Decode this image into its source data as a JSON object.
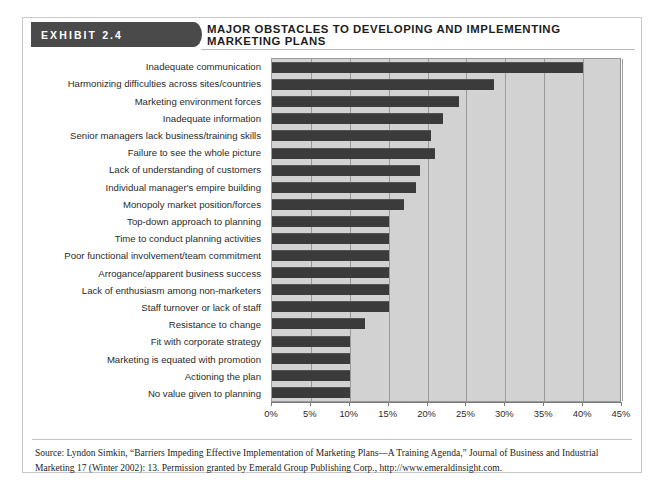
{
  "exhibit": {
    "tag": "EXHIBIT 2.4",
    "title": "MAJOR OBSTACLES TO DEVELOPING AND IMPLEMENTING MARKETING PLANS"
  },
  "source": {
    "text": "Source: Lyndon Simkin, “Barriers Impeding Effective Implementation of Marketing Plans—A Training Agenda,” Journal of Business and Industrial Marketing 17 (Winter 2002): 13. Permission granted by Emerald Group Publishing Corp., http://www.emeraldinsight.com."
  },
  "colors": {
    "bar": "#3b3b3b",
    "plot_background": "#d2d2d2",
    "gridline": "#9a9a9a",
    "tag_background": "#4a4a4a",
    "tag_text": "#ffffff",
    "text": "#2b2b2b"
  },
  "chart_data": {
    "type": "bar",
    "orientation": "horizontal",
    "title": "MAJOR OBSTACLES TO DEVELOPING AND IMPLEMENTING MARKETING PLANS",
    "xlabel": "",
    "ylabel": "",
    "xlim": [
      0,
      45
    ],
    "grid": true,
    "legend": false,
    "xticks": [
      0,
      5,
      10,
      15,
      20,
      25,
      30,
      35,
      40,
      45
    ],
    "xtick_labels": [
      "0%",
      "5%",
      "10%",
      "15%",
      "20%",
      "25%",
      "30%",
      "35%",
      "40%",
      "45%"
    ],
    "categories": [
      "Inadequate communication",
      "Harmonizing difficulties across sites/countries",
      "Marketing environment forces",
      "Inadequate information",
      "Senior managers lack business/training skills",
      "Failure to see the whole picture",
      "Lack of understanding of customers",
      "Individual manager's empire building",
      "Monopoly market position/forces",
      "Top-down approach to planning",
      "Time to conduct planning activities",
      "Poor functional involvement/team commitment",
      "Arrogance/apparent business success",
      "Lack of enthusiasm among non-marketers",
      "Staff turnover or lack of staff",
      "Resistance to change",
      "Fit with corporate strategy",
      "Marketing is equated with promotion",
      "Actioning the plan",
      "No value given to planning"
    ],
    "values": [
      40,
      28.5,
      24,
      22,
      20.5,
      21,
      19,
      18.5,
      17,
      15,
      15,
      15,
      15,
      15,
      15,
      12,
      10,
      10,
      10,
      10
    ],
    "value_unit": "%"
  }
}
